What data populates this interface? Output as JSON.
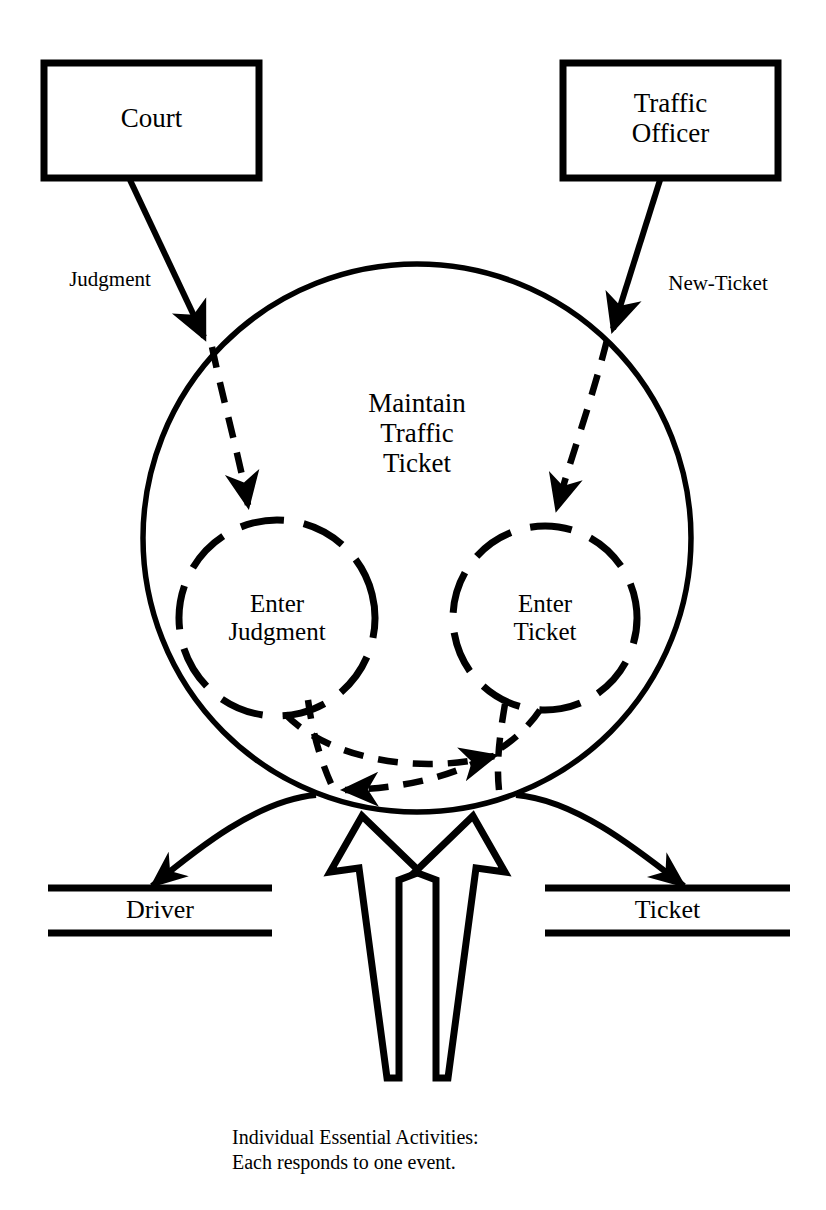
{
  "diagram": {
    "type": "data-flow-diagram",
    "caption": "Individual Essential Activities:\nEach responds to one event.",
    "caption_line1": "Individual Essential Activities:",
    "caption_line2": "Each responds to one event.",
    "colors": {
      "stroke": "#000000",
      "background": "#ffffff",
      "text": "#000000"
    },
    "external_entities": [
      {
        "id": "court",
        "label": "Court",
        "shape": "rectangle"
      },
      {
        "id": "traffic-officer",
        "label": "Traffic\nOfficer",
        "shape": "rectangle"
      }
    ],
    "processes": [
      {
        "id": "maintain-traffic-ticket",
        "label": "Maintain\nTraffic\nTicket",
        "shape": "circle",
        "style": "solid"
      },
      {
        "id": "enter-judgment",
        "label": "Enter\nJudgment",
        "shape": "circle",
        "style": "dashed"
      },
      {
        "id": "enter-ticket",
        "label": "Enter\nTicket",
        "shape": "circle",
        "style": "dashed"
      }
    ],
    "data_stores": [
      {
        "id": "driver",
        "label": "Driver"
      },
      {
        "id": "ticket",
        "label": "Ticket"
      }
    ],
    "flows": [
      {
        "id": "judgment",
        "label": "Judgment",
        "from": "court",
        "to": "maintain-traffic-ticket",
        "style": "solid"
      },
      {
        "id": "new-ticket",
        "label": "New-Ticket",
        "from": "traffic-officer",
        "to": "maintain-traffic-ticket",
        "style": "solid"
      },
      {
        "id": "judgment-inner",
        "label": "",
        "from": "maintain-traffic-ticket",
        "to": "enter-judgment",
        "style": "dashed"
      },
      {
        "id": "new-ticket-inner",
        "label": "",
        "from": "maintain-traffic-ticket",
        "to": "enter-ticket",
        "style": "dashed"
      },
      {
        "id": "to-driver",
        "label": "",
        "from": "maintain-traffic-ticket",
        "to": "driver",
        "style": "solid"
      },
      {
        "id": "to-ticket",
        "label": "",
        "from": "maintain-traffic-ticket",
        "to": "ticket",
        "style": "solid"
      }
    ],
    "annotation_arrow": {
      "id": "essential-activities-pointer",
      "style": "hollow-double-arrow",
      "points_to": [
        "enter-judgment-exit",
        "enter-ticket-exit"
      ]
    }
  }
}
